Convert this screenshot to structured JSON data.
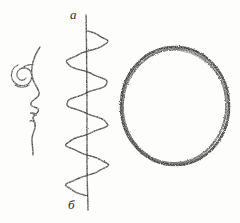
{
  "document": {
    "kind": "hand-drawn-sketch",
    "medium": "pencil on white paper",
    "background_color": "#fdfdfc",
    "ink_color": "#3a3a3a",
    "width": 240,
    "height": 223
  },
  "figures": [
    {
      "id": "face-profile",
      "name": "face profile with spiral eye",
      "description": "left-facing human profile outline: forehead, brow, nose, lips, chin and neck, with a concentric spiral drawn where the eye would be",
      "bbox": {
        "x": 12,
        "y": 45,
        "width": 46,
        "height": 112
      }
    },
    {
      "id": "helix-spiral",
      "name": "helix wound around vertical axis",
      "description": "a coiled spring / helix curve drawn around a straight vertical axis line, four full turns",
      "bbox": {
        "x": 62,
        "y": 14,
        "width": 50,
        "height": 196
      },
      "axis": {
        "x": 87,
        "y_top": 15,
        "y_bottom": 210
      },
      "turns": 4
    },
    {
      "id": "rough-circle",
      "name": "rough hand-drawn circle",
      "description": "a single closed circular stroke with grainy, wobbling pencil texture",
      "bbox": {
        "x": 121,
        "y": 47,
        "width": 108,
        "height": 118
      },
      "center": {
        "x": 175,
        "y": 106
      },
      "radius": {
        "x": 54,
        "y": 59
      }
    }
  ],
  "labels": {
    "top": "a",
    "bottom": "б"
  }
}
